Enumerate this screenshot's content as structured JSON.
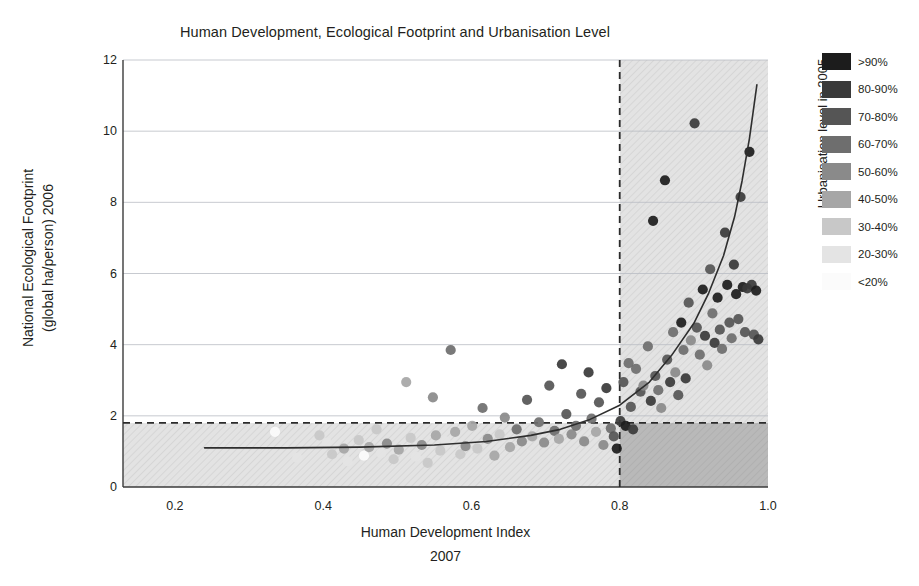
{
  "title": "Human Development, Ecological Footprint and Urbanisation Level",
  "axes": {
    "x_title": "Human Development Index",
    "x_subtitle": "2007",
    "y_title_line1": "National Ecological Footprint",
    "y_title_line2": "(global ha/person) 2006",
    "x_ticks": [
      "0.2",
      "0.4",
      "0.6",
      "0.8",
      "1.0"
    ],
    "y_ticks": [
      "0",
      "2",
      "4",
      "6",
      "8",
      "10",
      "12"
    ]
  },
  "legend": {
    "title": "Urbanisation level in 2005",
    "items": [
      {
        "label": ">90%",
        "color": "#1c1c1c"
      },
      {
        "label": "80-90%",
        "color": "#3a3a3a"
      },
      {
        "label": "70-80%",
        "color": "#555555"
      },
      {
        "label": "60-70%",
        "color": "#6e6e6e"
      },
      {
        "label": "50-60%",
        "color": "#8a8a8a"
      },
      {
        "label": "40-50%",
        "color": "#a6a6a6"
      },
      {
        "label": "30-40%",
        "color": "#c8c8c8"
      },
      {
        "label": "20-30%",
        "color": "#e4e4e4"
      },
      {
        "label": "<20%",
        "color": "#fbfbfb"
      }
    ]
  },
  "chart_data": {
    "type": "scatter",
    "title": "Human Development, Ecological Footprint and Urbanisation Level",
    "xlabel": "Human Development Index 2007",
    "ylabel": "National Ecological Footprint (global ha/person) 2006",
    "xlim": [
      0.13,
      1.0
    ],
    "ylim": [
      0,
      12
    ],
    "grid": true,
    "legend_position": "right",
    "color_legend_title": "Urbanisation level in 2005",
    "reference_lines": [
      {
        "name": "hdi-threshold",
        "orientation": "vertical",
        "value": 0.8,
        "style": "dashed"
      },
      {
        "name": "biocapacity-threshold",
        "orientation": "horizontal",
        "value": 1.8,
        "style": "dashed"
      }
    ],
    "shaded_regions": [
      {
        "name": "high-hdi-region",
        "x": [
          0.8,
          1.0
        ],
        "y": [
          0,
          12
        ],
        "shade": "light"
      },
      {
        "name": "sustainable-footprint-region",
        "x": [
          0.13,
          1.0
        ],
        "y": [
          0,
          1.8
        ],
        "shade": "light"
      },
      {
        "name": "sustainable-development-quadrant",
        "x": [
          0.8,
          1.0
        ],
        "y": [
          0,
          1.8
        ],
        "shade": "dark"
      }
    ],
    "trend_line": {
      "name": "exponential-fit",
      "description": "Ecological footprint rises steeply above HDI 0.8",
      "points": [
        [
          0.24,
          1.1
        ],
        [
          0.35,
          1.1
        ],
        [
          0.45,
          1.12
        ],
        [
          0.55,
          1.18
        ],
        [
          0.62,
          1.28
        ],
        [
          0.68,
          1.45
        ],
        [
          0.72,
          1.62
        ],
        [
          0.76,
          1.9
        ],
        [
          0.8,
          2.3
        ],
        [
          0.84,
          2.95
        ],
        [
          0.87,
          3.7
        ],
        [
          0.9,
          4.6
        ],
        [
          0.92,
          5.45
        ],
        [
          0.94,
          6.5
        ],
        [
          0.955,
          7.6
        ],
        [
          0.965,
          8.6
        ],
        [
          0.975,
          9.8
        ],
        [
          0.985,
          11.3
        ]
      ]
    },
    "series": [
      {
        "name": "countries",
        "point_fields": [
          "hdi",
          "footprint",
          "urbanisation_bin"
        ],
        "points": [
          [
            0.335,
            1.55,
            "<20%"
          ],
          [
            0.365,
            0.82,
            "20-30%"
          ],
          [
            0.395,
            1.45,
            "30-40%"
          ],
          [
            0.405,
            1.25,
            "20-30%"
          ],
          [
            0.412,
            0.92,
            "30-40%"
          ],
          [
            0.428,
            1.08,
            "40-50%"
          ],
          [
            0.433,
            0.72,
            "20-30%"
          ],
          [
            0.448,
            1.32,
            "30-40%"
          ],
          [
            0.455,
            0.88,
            "<20%"
          ],
          [
            0.462,
            1.12,
            "40-50%"
          ],
          [
            0.472,
            1.62,
            "30-40%"
          ],
          [
            0.478,
            0.95,
            "20-30%"
          ],
          [
            0.486,
            1.22,
            "50-60%"
          ],
          [
            0.495,
            0.78,
            "30-40%"
          ],
          [
            0.502,
            1.05,
            "40-50%"
          ],
          [
            0.512,
            2.95,
            "40-50%"
          ],
          [
            0.518,
            1.38,
            "30-40%"
          ],
          [
            0.525,
            0.85,
            "20-30%"
          ],
          [
            0.533,
            1.18,
            "50-60%"
          ],
          [
            0.541,
            0.68,
            "30-40%"
          ],
          [
            0.548,
            2.52,
            "50-60%"
          ],
          [
            0.552,
            1.45,
            "40-50%"
          ],
          [
            0.558,
            1.02,
            "30-40%"
          ],
          [
            0.565,
            1.28,
            "20-30%"
          ],
          [
            0.572,
            3.85,
            "60-70%"
          ],
          [
            0.578,
            1.55,
            "40-50%"
          ],
          [
            0.585,
            0.92,
            "30-40%"
          ],
          [
            0.592,
            1.15,
            "50-60%"
          ],
          [
            0.601,
            1.72,
            "40-50%"
          ],
          [
            0.608,
            1.08,
            "30-40%"
          ],
          [
            0.615,
            2.22,
            "60-70%"
          ],
          [
            0.622,
            1.35,
            "50-60%"
          ],
          [
            0.631,
            0.88,
            "40-50%"
          ],
          [
            0.638,
            1.48,
            "30-40%"
          ],
          [
            0.645,
            1.95,
            "50-60%"
          ],
          [
            0.652,
            1.12,
            "40-50%"
          ],
          [
            0.661,
            1.62,
            "60-70%"
          ],
          [
            0.668,
            1.28,
            "50-60%"
          ],
          [
            0.675,
            2.45,
            "70-80%"
          ],
          [
            0.682,
            1.42,
            "40-50%"
          ],
          [
            0.691,
            1.82,
            "60-70%"
          ],
          [
            0.698,
            1.25,
            "50-60%"
          ],
          [
            0.705,
            2.85,
            "70-80%"
          ],
          [
            0.712,
            1.58,
            "60-70%"
          ],
          [
            0.718,
            1.35,
            "40-50%"
          ],
          [
            0.722,
            3.45,
            "80-90%"
          ],
          [
            0.728,
            2.05,
            "70-80%"
          ],
          [
            0.735,
            1.48,
            "50-60%"
          ],
          [
            0.741,
            1.72,
            "60-70%"
          ],
          [
            0.748,
            2.62,
            "70-80%"
          ],
          [
            0.752,
            1.28,
            "50-60%"
          ],
          [
            0.758,
            3.22,
            "80-90%"
          ],
          [
            0.762,
            1.92,
            "60-70%"
          ],
          [
            0.768,
            1.55,
            "40-50%"
          ],
          [
            0.772,
            2.38,
            "70-80%"
          ],
          [
            0.778,
            1.18,
            "50-60%"
          ],
          [
            0.782,
            2.78,
            "80-90%"
          ],
          [
            0.788,
            1.65,
            "60-70%"
          ],
          [
            0.792,
            1.42,
            "70-80%"
          ],
          [
            0.796,
            1.08,
            ">90%"
          ],
          [
            0.801,
            1.85,
            "80-90%"
          ],
          [
            0.805,
            2.95,
            "70-80%"
          ],
          [
            0.808,
            1.72,
            ">90%"
          ],
          [
            0.812,
            3.48,
            "60-70%"
          ],
          [
            0.815,
            2.25,
            "70-80%"
          ],
          [
            0.818,
            1.62,
            "80-90%"
          ],
          [
            0.822,
            3.32,
            "60-70%"
          ],
          [
            0.828,
            2.68,
            "70-80%"
          ],
          [
            0.832,
            2.85,
            "50-60%"
          ],
          [
            0.838,
            3.95,
            "60-70%"
          ],
          [
            0.842,
            2.42,
            "80-90%"
          ],
          [
            0.845,
            7.48,
            ">90%"
          ],
          [
            0.848,
            3.12,
            "70-80%"
          ],
          [
            0.852,
            2.72,
            "60-70%"
          ],
          [
            0.856,
            2.22,
            "50-60%"
          ],
          [
            0.861,
            8.62,
            ">90%"
          ],
          [
            0.864,
            3.58,
            "70-80%"
          ],
          [
            0.868,
            2.95,
            "80-90%"
          ],
          [
            0.872,
            4.35,
            "60-70%"
          ],
          [
            0.875,
            3.22,
            "50-60%"
          ],
          [
            0.879,
            2.58,
            "70-80%"
          ],
          [
            0.883,
            4.62,
            ">90%"
          ],
          [
            0.886,
            3.85,
            "60-70%"
          ],
          [
            0.889,
            3.05,
            "80-90%"
          ],
          [
            0.893,
            5.18,
            "70-80%"
          ],
          [
            0.896,
            4.12,
            "50-60%"
          ],
          [
            0.901,
            10.22,
            "80-90%"
          ],
          [
            0.904,
            4.48,
            "70-80%"
          ],
          [
            0.908,
            3.72,
            "60-70%"
          ],
          [
            0.912,
            5.55,
            ">90%"
          ],
          [
            0.915,
            4.25,
            "80-90%"
          ],
          [
            0.918,
            3.42,
            "50-60%"
          ],
          [
            0.922,
            6.12,
            "70-80%"
          ],
          [
            0.925,
            4.88,
            "60-70%"
          ],
          [
            0.928,
            4.05,
            "80-90%"
          ],
          [
            0.932,
            5.32,
            ">90%"
          ],
          [
            0.935,
            4.42,
            "70-80%"
          ],
          [
            0.938,
            3.88,
            "60-70%"
          ],
          [
            0.942,
            7.15,
            "80-90%"
          ],
          [
            0.945,
            5.68,
            ">90%"
          ],
          [
            0.948,
            4.62,
            "70-80%"
          ],
          [
            0.951,
            4.18,
            "60-70%"
          ],
          [
            0.954,
            6.25,
            "80-90%"
          ],
          [
            0.957,
            5.42,
            ">90%"
          ],
          [
            0.96,
            4.72,
            "70-80%"
          ],
          [
            0.963,
            8.15,
            "80-90%"
          ],
          [
            0.966,
            5.62,
            ">90%"
          ],
          [
            0.969,
            4.35,
            "70-80%"
          ],
          [
            0.972,
            5.58,
            "80-90%"
          ],
          [
            0.975,
            9.42,
            ">90%"
          ],
          [
            0.978,
            5.68,
            "80-90%"
          ],
          [
            0.981,
            4.28,
            "70-80%"
          ],
          [
            0.984,
            5.52,
            ">90%"
          ],
          [
            0.987,
            4.15,
            "80-90%"
          ]
        ]
      }
    ]
  }
}
